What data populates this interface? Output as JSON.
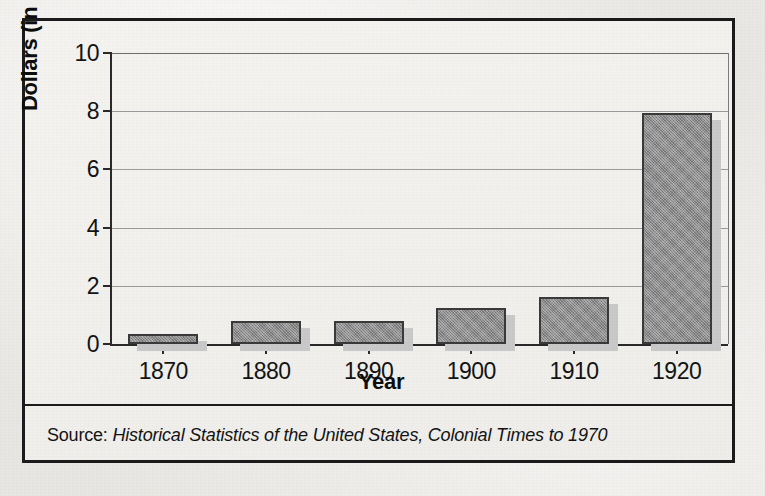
{
  "figure": {
    "source_label": "Source:",
    "source_title": "Historical Statistics of the United States, Colonial Times to 1970"
  },
  "chart_data": {
    "type": "bar",
    "title": "",
    "xlabel": "Year",
    "ylabel": "Dollars (in billions)",
    "categories": [
      "1870",
      "1880",
      "1890",
      "1900",
      "1910",
      "1920"
    ],
    "values": [
      0.35,
      0.79,
      0.79,
      1.24,
      1.6,
      7.95
    ],
    "ylim": [
      0,
      10
    ],
    "yticks": [
      0,
      2,
      4,
      6,
      8,
      10
    ],
    "ytick_labels": [
      "0",
      "2",
      "4",
      "6",
      "8",
      "10"
    ],
    "grid": true,
    "legend": "none",
    "bar_color": "#8d8d8d",
    "bar_outline_color": "#3a3a3a",
    "bar_shadow_color": "#c9c9c9",
    "frame_color": "#1b1b1b",
    "paper_color": "#f2f1ee"
  }
}
